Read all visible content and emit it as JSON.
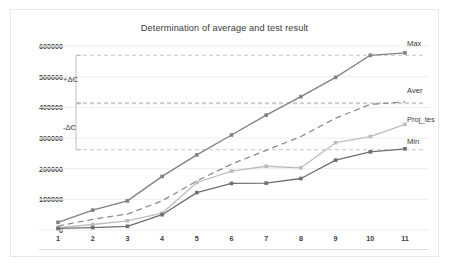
{
  "chart_data": {
    "type": "line",
    "title": "Determination of average and test result",
    "xlabel": "",
    "ylabel": "",
    "categories": [
      "1",
      "2",
      "3",
      "4",
      "5",
      "6",
      "7",
      "8",
      "9",
      "10",
      "11"
    ],
    "x": [
      1,
      2,
      3,
      4,
      5,
      6,
      7,
      8,
      9,
      10,
      11
    ],
    "ylim": [
      0,
      620000
    ],
    "xlim": [
      1,
      11
    ],
    "yticks": [
      0,
      100000,
      200000,
      300000,
      400000,
      500000,
      600000
    ],
    "ytick_labels": [
      "0",
      "100000",
      "200000",
      "300000",
      "400000",
      "500000",
      "600000"
    ],
    "grid": "horizontal",
    "legend_position": "right-inline-end-labels",
    "series": [
      {
        "name": "Max",
        "label": "Max",
        "color": "#808080",
        "style": "solid",
        "marker": "diamond",
        "values": [
          25000,
          65000,
          95000,
          175000,
          245000,
          310000,
          375000,
          435000,
          498000,
          570000,
          578000
        ]
      },
      {
        "name": "Aver",
        "label": "Aver",
        "color": "#8c8c8c",
        "style": "dashed",
        "marker": "none",
        "values": [
          13000,
          35000,
          52000,
          95000,
          160000,
          215000,
          260000,
          305000,
          365000,
          410000,
          418000
        ]
      },
      {
        "name": "Proj_tes",
        "label": "Proj_tes",
        "color": "#bdbdbd",
        "style": "solid",
        "marker": "diamond",
        "values": [
          8000,
          18000,
          30000,
          55000,
          155000,
          192000,
          208000,
          203000,
          285000,
          305000,
          345000
        ]
      },
      {
        "name": "Min",
        "label": "Min",
        "color": "#6e6e6e",
        "style": "solid",
        "marker": "diamond",
        "values": [
          5000,
          8000,
          12000,
          50000,
          122000,
          152000,
          153000,
          168000,
          228000,
          255000,
          265000
        ]
      }
    ],
    "annotations": [
      {
        "name": "plus-delta-c",
        "label": "+ΔC",
        "type": "bracket",
        "y_top": 570000,
        "y_bottom": 415000,
        "label_y": 492500
      },
      {
        "name": "minus-delta-c",
        "label": "-ΔC",
        "type": "bracket",
        "y_top": 412000,
        "y_bottom": 262000,
        "label_y": 337000
      }
    ],
    "annotation_guide_lines": [
      {
        "name": "guide-max",
        "y": 570000
      },
      {
        "name": "guide-aver-upper",
        "y": 415000
      },
      {
        "name": "guide-aver-lower",
        "y": 412000
      },
      {
        "name": "guide-min",
        "y": 262000
      }
    ],
    "colors": {
      "grid": "#ededed",
      "guide": "#b9b9b9",
      "text": "#3c3c3c",
      "frame": "#e8e8e8"
    }
  }
}
